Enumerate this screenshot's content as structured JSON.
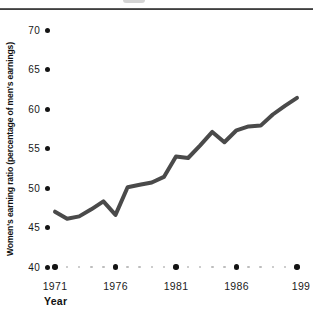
{
  "chart_data": {
    "type": "line",
    "title": "",
    "xlabel": "Year",
    "ylabel": "Women's earning ratio (percentage of men's earnings)",
    "x": [
      1971,
      1972,
      1973,
      1974,
      1975,
      1976,
      1977,
      1978,
      1979,
      1980,
      1981,
      1982,
      1983,
      1984,
      1985,
      1986,
      1987,
      1988,
      1989,
      1990,
      1991
    ],
    "values": [
      47.0,
      46.1,
      46.4,
      47.3,
      48.3,
      46.6,
      50.1,
      50.4,
      50.7,
      51.4,
      54.0,
      53.8,
      55.4,
      57.1,
      55.8,
      57.3,
      57.8,
      57.9,
      59.3,
      60.4,
      61.4
    ],
    "yticks": [
      70,
      65,
      60,
      55,
      50,
      45,
      40
    ],
    "xtick_years": [
      1971,
      1976,
      1981,
      1986,
      1991
    ],
    "xtick_labels": [
      "1971",
      "1976",
      "1981",
      "1986",
      "199"
    ],
    "ylim": [
      40,
      70
    ],
    "grid": false,
    "legend": null,
    "line_color": "#4a4a4a",
    "tick_dot_color": "#141414",
    "minor_dot_color": "#bdbdbd"
  }
}
